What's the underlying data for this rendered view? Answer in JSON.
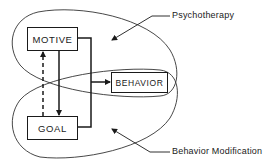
{
  "diagram": {
    "nodes": [
      {
        "id": "motive",
        "label": "MOTIVE"
      },
      {
        "id": "goal",
        "label": "GOAL"
      },
      {
        "id": "behavior",
        "label": "BEHAVIOR"
      }
    ],
    "regions": [
      {
        "id": "psychotherapy",
        "label": "Psychotherapy",
        "encloses": [
          "motive",
          "behavior"
        ]
      },
      {
        "id": "behavior_modification",
        "label": "Behavior Modification",
        "encloses": [
          "goal",
          "behavior"
        ]
      }
    ],
    "edges": [
      {
        "from": "motive",
        "to": "goal",
        "style": "solid"
      },
      {
        "from": "goal",
        "to": "motive",
        "style": "dashed"
      },
      {
        "from": "motive",
        "to": "behavior",
        "style": "solid"
      },
      {
        "from": "goal",
        "to": "behavior",
        "style": "solid"
      }
    ]
  }
}
